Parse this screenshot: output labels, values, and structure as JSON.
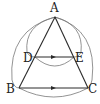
{
  "diagram": {
    "type": "geometry",
    "points": {
      "A": {
        "label": "A",
        "x": 55,
        "y": 17
      },
      "D": {
        "label": "D",
        "x": 35,
        "y": 57
      },
      "E": {
        "label": "E",
        "x": 74,
        "y": 57
      },
      "B": {
        "label": "B",
        "x": 19,
        "y": 88
      },
      "C": {
        "label": "C",
        "x": 88,
        "y": 88
      }
    },
    "segments": [
      "AB",
      "AC",
      "DE",
      "BC"
    ],
    "arrows": [
      "DE",
      "BC"
    ],
    "colors": {
      "line": "#2a2a2a",
      "arc": "#6a6a6a"
    }
  }
}
